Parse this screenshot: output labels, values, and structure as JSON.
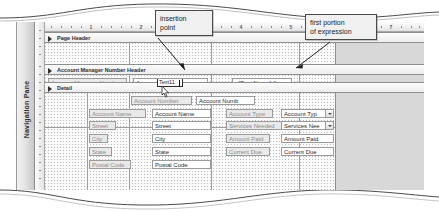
{
  "window": {
    "navigation_pane_label": "Navigation Pane"
  },
  "ruler": {
    "horizontal_numbers": [
      "1",
      "2",
      "3",
      "4",
      "5",
      "6",
      "7"
    ],
    "units": "inches"
  },
  "sections": [
    {
      "name": "page-header",
      "label": "Page Header"
    },
    {
      "name": "group-header",
      "label": "Account Manager Number Header"
    },
    {
      "name": "detail",
      "label": "Detail"
    }
  ],
  "group_header_controls": {
    "label": "Account Manager Number",
    "textbox_text": "Account Ma",
    "editing_name": "Text11",
    "expression_textbox": "=[First Name] &"
  },
  "detail_controls": [
    {
      "label": "Account Number",
      "field": "Account Numb",
      "type": "textbox"
    },
    {
      "label": "Account Name",
      "field": "Account Name",
      "type": "textbox"
    },
    {
      "label": "Street",
      "field": "Street",
      "type": "textbox"
    },
    {
      "label": "City",
      "field": "City",
      "type": "textbox"
    },
    {
      "label": "State",
      "field": "State",
      "type": "textbox"
    },
    {
      "label": "Postal Code",
      "field": "Postal Code",
      "type": "textbox"
    }
  ],
  "detail_controls_right": [
    {
      "label": "Account Type",
      "field": "Account Typ",
      "type": "combobox"
    },
    {
      "label": "Services Needed",
      "field": "Services Nee",
      "type": "combobox"
    },
    {
      "label": "Amount Paid",
      "field": "Amount Paid",
      "type": "textbox"
    },
    {
      "label": "Current Due",
      "field": "Current Due",
      "type": "textbox"
    }
  ],
  "callouts": [
    {
      "name": "insertion-point",
      "line1": "insertion",
      "line2": "point"
    },
    {
      "name": "first-portion-expression",
      "line1": "first portion",
      "line2": "of expression"
    }
  ],
  "colors": {
    "label_fill": "#e9e9e9",
    "control_border": "#9b9b9b",
    "section_bar": "#ededed",
    "grey_region": "#d8d8d8",
    "callout_fill": "#f0f0f0"
  }
}
